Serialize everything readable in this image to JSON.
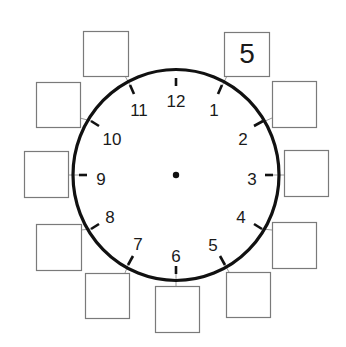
{
  "diagram": {
    "type": "clock-worksheet",
    "colors": {
      "rim": "#111111",
      "tick": "#111111",
      "numeral": "#1a1a1a",
      "box_border": "#7a7a7a",
      "connector": "#9a9a9a",
      "background": "#ffffff"
    },
    "clock": {
      "center": [
        176,
        175
      ],
      "rx": 103,
      "ry": 105.5,
      "center_dot_radius": 3.2
    },
    "hours": [
      {
        "label": "12",
        "num_pos": [
          176,
          103
        ],
        "tick": [
          [
            176,
            78
          ],
          [
            176,
            86
          ]
        ],
        "edge": [
          176,
          69
        ],
        "box": {
          "x": 155,
          "y": 0,
          "w": 0,
          "h": 0,
          "value": "",
          "hidden": true
        }
      },
      {
        "label": "1",
        "num_pos": [
          214,
          112
        ],
        "tick": [
          [
            222,
            85
          ],
          [
            218,
            94
          ]
        ],
        "edge": [
          227,
          78
        ],
        "box": {
          "x": 224,
          "y": 32,
          "w": 45,
          "h": 44,
          "value": "5"
        }
      },
      {
        "label": "2",
        "num_pos": [
          243,
          141
        ],
        "tick": [
          [
            263,
            121
          ],
          [
            254,
            126
          ]
        ],
        "edge": [
          271,
          118
        ],
        "box": {
          "x": 272,
          "y": 81,
          "w": 44,
          "h": 46,
          "value": ""
        }
      },
      {
        "label": "3",
        "num_pos": [
          252,
          181
        ],
        "tick": [
          [
            265,
            175
          ],
          [
            273,
            175
          ]
        ],
        "edge": [
          279,
          175
        ],
        "box": {
          "x": 284,
          "y": 150,
          "w": 44,
          "h": 46,
          "value": ""
        }
      },
      {
        "label": "4",
        "num_pos": [
          241,
          219
        ],
        "tick": [
          [
            254,
            224
          ],
          [
            262,
            229
          ]
        ],
        "edge": [
          270,
          230
        ],
        "box": {
          "x": 272,
          "y": 222,
          "w": 44,
          "h": 46,
          "value": ""
        }
      },
      {
        "label": "5",
        "num_pos": [
          213,
          247
        ],
        "tick": [
          [
            220,
            256
          ],
          [
            225,
            265
          ]
        ],
        "edge": [
          229,
          271
        ],
        "box": {
          "x": 226,
          "y": 272,
          "w": 44,
          "h": 45,
          "value": ""
        }
      },
      {
        "label": "6",
        "num_pos": [
          176,
          258
        ],
        "tick": [
          [
            176,
            266
          ],
          [
            176,
            274
          ]
        ],
        "edge": [
          176,
          280
        ],
        "box": {
          "x": 155,
          "y": 286,
          "w": 44,
          "h": 46,
          "value": ""
        }
      },
      {
        "label": "7",
        "num_pos": [
          138,
          246
        ],
        "tick": [
          [
            133,
            256
          ],
          [
            128,
            265
          ]
        ],
        "edge": [
          125,
          271
        ],
        "box": {
          "x": 85,
          "y": 273,
          "w": 44,
          "h": 45,
          "value": ""
        }
      },
      {
        "label": "8",
        "num_pos": [
          110,
          219
        ],
        "tick": [
          [
            99,
            224
          ],
          [
            91,
            229
          ]
        ],
        "edge": [
          83,
          230
        ],
        "box": {
          "x": 36,
          "y": 224,
          "w": 45,
          "h": 46,
          "value": ""
        }
      },
      {
        "label": "9",
        "num_pos": [
          101,
          181
        ],
        "tick": [
          [
            87,
            175
          ],
          [
            79,
            175
          ]
        ],
        "edge": [
          73,
          175
        ],
        "box": {
          "x": 24,
          "y": 151,
          "w": 44,
          "h": 46,
          "value": ""
        }
      },
      {
        "label": "10",
        "num_pos": [
          112,
          141
        ],
        "tick": [
          [
            99,
            126
          ],
          [
            91,
            121
          ]
        ],
        "edge": [
          83,
          118
        ],
        "box": {
          "x": 36,
          "y": 82,
          "w": 44,
          "h": 45,
          "value": ""
        }
      },
      {
        "label": "11",
        "num_pos": [
          139,
          112
        ],
        "tick": [
          [
            134,
            94
          ],
          [
            130,
            85
          ]
        ],
        "edge": [
          125,
          78
        ],
        "box": {
          "x": 83,
          "y": 31,
          "w": 45,
          "h": 45,
          "value": ""
        }
      }
    ]
  }
}
